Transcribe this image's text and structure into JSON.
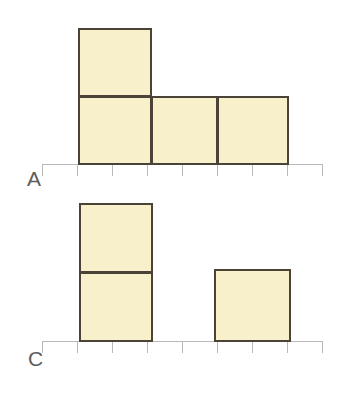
{
  "figure": {
    "background_color": "#FFFFFF",
    "width": 347,
    "height": 413,
    "cube_fill_color": "#F8F0CB",
    "cube_border_color": "#4B4338",
    "axis_color": "#B9B9B9",
    "label_color": "#5C5C5C"
  },
  "rows": [
    {
      "label": "A",
      "label_x": 27,
      "label_y": 168,
      "baseline_y": 164,
      "axis_x_start": 42,
      "axis_x_end": 322,
      "tick_count": 9,
      "tick_spacing": 35,
      "tick_height": 12,
      "cubes": [
        {
          "x": 78,
          "y": 28,
          "w": 74,
          "h": 69
        },
        {
          "x": 78,
          "y": 96,
          "w": 74,
          "h": 69
        },
        {
          "x": 151,
          "y": 96,
          "w": 67,
          "h": 69
        },
        {
          "x": 217,
          "y": 96,
          "w": 72,
          "h": 69
        }
      ]
    },
    {
      "label": "C",
      "label_x": 28,
      "label_y": 348,
      "baseline_y": 341,
      "axis_x_start": 42,
      "axis_x_end": 322,
      "tick_count": 9,
      "tick_spacing": 35,
      "tick_height": 12,
      "cubes": [
        {
          "x": 79,
          "y": 203,
          "w": 74,
          "h": 70
        },
        {
          "x": 79,
          "y": 272,
          "w": 74,
          "h": 70
        },
        {
          "x": 214,
          "y": 269,
          "w": 77,
          "h": 73
        }
      ]
    }
  ],
  "chart_data": {
    "type": "bar",
    "title": "",
    "xlabel": "",
    "ylabel": "",
    "unit_square_px": 70,
    "grid": false,
    "legend": null,
    "charts": [
      {
        "name": "A",
        "label": "A",
        "categories": [
          "1",
          "2",
          "3",
          "4",
          "5",
          "6",
          "7",
          "8"
        ],
        "values": [
          2,
          1,
          1,
          0,
          0,
          0,
          0,
          0
        ],
        "occupied_columns": [
          1,
          2,
          3
        ],
        "total_squares": 4,
        "max_height": 2,
        "ylim": [
          0,
          2
        ]
      },
      {
        "name": "C",
        "label": "C",
        "categories": [
          "1",
          "2",
          "3",
          "4",
          "5",
          "6",
          "7",
          "8"
        ],
        "values": [
          2,
          0,
          0,
          1,
          0,
          0,
          0,
          0
        ],
        "occupied_columns": [
          1,
          4
        ],
        "total_squares": 3,
        "max_height": 2,
        "ylim": [
          0,
          2
        ]
      }
    ]
  }
}
